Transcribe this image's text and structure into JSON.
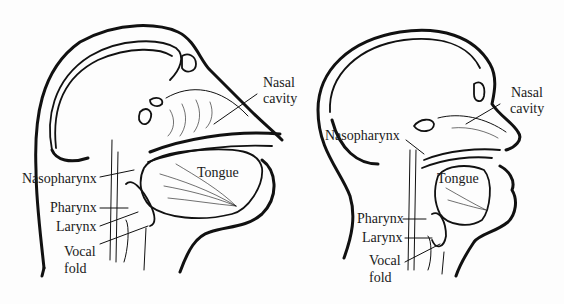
{
  "figure": {
    "panels": [
      {
        "id": "left",
        "subject": "non-human primate head sagittal section",
        "labels": {
          "nasal_cavity": "Nasal\ncavity",
          "nasal_cavity_l1": "Nasal",
          "nasal_cavity_l2": "cavity",
          "tongue": "Tongue",
          "nasopharynx": "Nasopharynx",
          "pharynx": "Pharynx",
          "larynx": "Larynx",
          "vocal_fold_l1": "Vocal",
          "vocal_fold_l2": "fold"
        }
      },
      {
        "id": "right",
        "subject": "human head sagittal section",
        "labels": {
          "nasal_cavity_l1": "Nasal",
          "nasal_cavity_l2": "cavity",
          "tongue": "Tongue",
          "nasopharynx": "Nasopharynx",
          "pharynx": "Pharynx",
          "larynx": "Larynx",
          "vocal_fold_l1": "Vocal",
          "vocal_fold_l2": "fold"
        }
      }
    ],
    "colors": {
      "ink": "#111111",
      "paper": "#fdfdfd"
    }
  }
}
